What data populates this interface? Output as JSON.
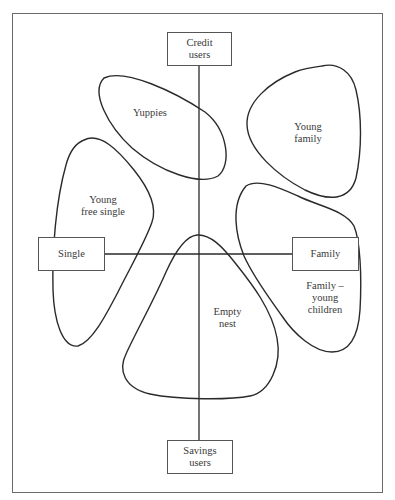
{
  "diagram": {
    "type": "perceptual-map",
    "axes": {
      "vertical": {
        "top_label": "Credit\nusers",
        "bottom_label": "Savings\nusers"
      },
      "horizontal": {
        "left_label": "Single",
        "right_label": "Family"
      }
    },
    "segments": [
      {
        "id": "yuppies",
        "label": "Yuppies"
      },
      {
        "id": "young-family",
        "label": "Young\nfamily"
      },
      {
        "id": "young-free-single",
        "label": "Young\nfree single"
      },
      {
        "id": "empty-nest",
        "label": "Empty\nnest"
      },
      {
        "id": "family-young-children",
        "label": "Family –\nyoung\nchildren"
      }
    ],
    "colors": {
      "line": "#2a2a2a",
      "frame": "#6a6a6a",
      "background": "#ffffff"
    }
  }
}
